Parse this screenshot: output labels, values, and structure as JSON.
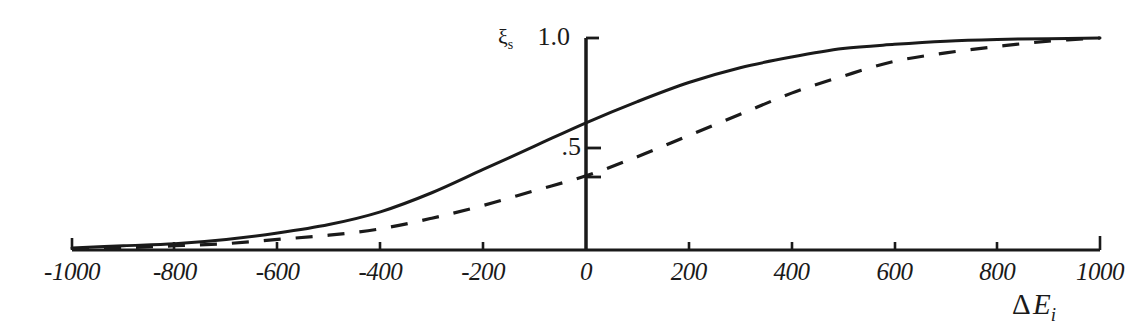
{
  "chart_data": {
    "type": "line",
    "title": "",
    "subtitle": "",
    "xlabel": "Δ E_i",
    "xlabel_symbol": "Δ",
    "xlabel_variable": "E",
    "xlabel_subscript": "i",
    "ylabel": "ξ_s",
    "ylabel_symbol": "ξ",
    "ylabel_subscript": "s",
    "grid": false,
    "legend": "none",
    "xlim": [
      -1000,
      1000
    ],
    "ylim": [
      0,
      1.0
    ],
    "xticks": [
      -1000,
      -800,
      -600,
      -400,
      -200,
      0,
      200,
      400,
      600,
      800,
      1000
    ],
    "xtick_labels": [
      "-1000",
      "-800",
      "-600",
      "-400",
      "-200",
      "0",
      "200",
      "400",
      "600",
      "800",
      "1000"
    ],
    "yticks": [
      0.25,
      0.5,
      1.0
    ],
    "ytick_labels": [
      "",
      ".5",
      "1.0"
    ],
    "ytick_labels_shown": [
      ".5",
      "1.0"
    ],
    "series": [
      {
        "name": "solid-curve",
        "style": "solid",
        "color": "#1a1a1a",
        "x": [
          -1000,
          -900,
          -800,
          -700,
          -600,
          -500,
          -400,
          -300,
          -200,
          -100,
          0,
          100,
          200,
          300,
          400,
          500,
          600,
          700,
          800,
          900,
          1000
        ],
        "values": [
          0.01,
          0.02,
          0.03,
          0.05,
          0.08,
          0.12,
          0.18,
          0.27,
          0.38,
          0.49,
          0.6,
          0.7,
          0.79,
          0.86,
          0.91,
          0.95,
          0.97,
          0.985,
          0.993,
          0.997,
          1.0
        ]
      },
      {
        "name": "dashed-curve",
        "style": "dashed",
        "color": "#1a1a1a",
        "x": [
          -1000,
          -900,
          -800,
          -700,
          -600,
          -500,
          -400,
          -300,
          -200,
          -100,
          0,
          100,
          200,
          300,
          400,
          500,
          600,
          700,
          800,
          900,
          1000
        ],
        "values": [
          0.005,
          0.01,
          0.02,
          0.03,
          0.05,
          0.07,
          0.1,
          0.15,
          0.21,
          0.28,
          0.35,
          0.44,
          0.54,
          0.64,
          0.74,
          0.82,
          0.89,
          0.93,
          0.96,
          0.985,
          1.0
        ]
      }
    ],
    "axis_color": "#1a1a1a",
    "background_color": "#ffffff"
  },
  "layout": {
    "plot_left_px": 72,
    "plot_right_px": 1100,
    "x_axis_y_px": 250,
    "y_axis_x_px": 586,
    "y_top_px": 38
  }
}
